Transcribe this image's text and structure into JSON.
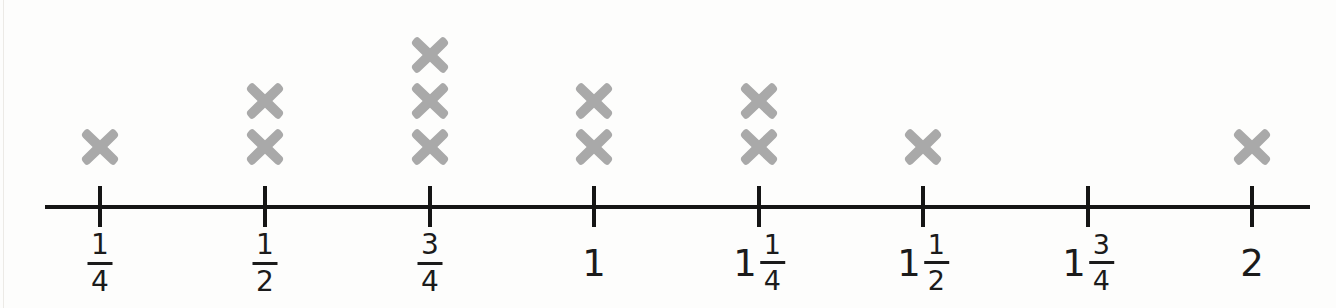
{
  "figure": {
    "kind": "line-plot",
    "mark_symbol": "x",
    "mark_color": "#a9a9a9",
    "axis_color": "#151515",
    "background_color": "#fdfdfc",
    "total_marks": 12
  },
  "chart_data": {
    "type": "bar",
    "title": "",
    "xlabel": "",
    "ylabel": "",
    "categories": [
      "1/4",
      "1/2",
      "3/4",
      "1",
      "1 1/4",
      "1 1/2",
      "1 3/4",
      "2"
    ],
    "values": [
      1,
      2,
      3,
      2,
      2,
      1,
      0,
      1
    ],
    "x": [
      0.25,
      0.5,
      0.75,
      1,
      1.25,
      1.5,
      1.75,
      2
    ],
    "xlim": [
      0.25,
      2
    ],
    "ylim": [
      0,
      3
    ],
    "grid": false,
    "legend": null
  },
  "axis": {
    "ticks": [
      {
        "id": "tick-one-quarter",
        "value": 0.25,
        "x": 100,
        "whole": "",
        "numerator": "1",
        "denominator": "4",
        "count": 1
      },
      {
        "id": "tick-one-half",
        "value": 0.5,
        "x": 265,
        "whole": "",
        "numerator": "1",
        "denominator": "2",
        "count": 2
      },
      {
        "id": "tick-three-quarters",
        "value": 0.75,
        "x": 430,
        "whole": "",
        "numerator": "3",
        "denominator": "4",
        "count": 3
      },
      {
        "id": "tick-one",
        "value": 1,
        "x": 594,
        "whole": "1",
        "numerator": "",
        "denominator": "",
        "count": 2
      },
      {
        "id": "tick-one-and-one-quarter",
        "value": 1.25,
        "x": 759,
        "whole": "1",
        "numerator": "1",
        "denominator": "4",
        "count": 2
      },
      {
        "id": "tick-one-and-one-half",
        "value": 1.5,
        "x": 923,
        "whole": "1",
        "numerator": "1",
        "denominator": "2",
        "count": 1
      },
      {
        "id": "tick-one-and-three-quarters",
        "value": 1.75,
        "x": 1088,
        "whole": "1",
        "numerator": "3",
        "denominator": "4",
        "count": 0
      },
      {
        "id": "tick-two",
        "value": 2,
        "x": 1252,
        "whole": "2",
        "numerator": "",
        "denominator": "",
        "count": 1
      }
    ]
  }
}
